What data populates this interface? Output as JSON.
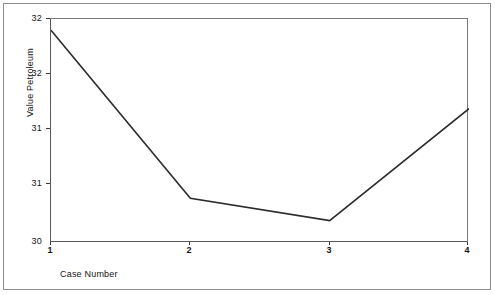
{
  "chart_data": {
    "type": "line",
    "title": "",
    "xlabel": "Case Number",
    "ylabel": "Value Petroleum",
    "categories": [
      "1",
      "2",
      "3",
      "4"
    ],
    "x": [
      1,
      2,
      3,
      4
    ],
    "values": [
      31.9,
      30.4,
      30.2,
      31.2
    ],
    "series": [
      {
        "name": "Value Petroleum",
        "values": [
          31.9,
          30.4,
          30.2,
          31.2
        ]
      }
    ],
    "xlim": [
      1,
      4
    ],
    "ylim": [
      30.0,
      32.0
    ],
    "xticks": [
      "1",
      "2",
      "3",
      "4"
    ],
    "xtick_values": [
      1,
      2,
      3,
      4
    ],
    "yticks": [
      "32",
      "32",
      "31",
      "31",
      "30"
    ],
    "ytick_values": [
      32.0,
      31.5,
      31.0,
      30.5,
      30.0
    ],
    "grid": false,
    "legend": "none",
    "line_color": "#2b2b2b",
    "axis_color": "#5a5a5a",
    "frame_color": "#8c8c8c",
    "background_color": "#ffffff",
    "markers": false
  },
  "axes": {
    "y_title": "Value Petroleum",
    "x_title": "Case Number",
    "y_tick_labels": [
      "32",
      "32",
      "31",
      "31",
      "30"
    ],
    "x_tick_labels": [
      "1",
      "2",
      "3",
      "4"
    ]
  }
}
